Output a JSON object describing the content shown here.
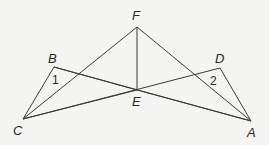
{
  "diagram": {
    "points": {
      "F": {
        "x": 137,
        "y": 27,
        "label": "F",
        "lx": 132,
        "ly": 20
      },
      "B": {
        "x": 54,
        "y": 67,
        "label": "B",
        "lx": 48,
        "ly": 63
      },
      "C": {
        "x": 23,
        "y": 119,
        "label": "C",
        "lx": 13,
        "ly": 135
      },
      "E": {
        "x": 137,
        "y": 90,
        "label": "E",
        "lx": 132,
        "ly": 106
      },
      "D": {
        "x": 220,
        "y": 68,
        "label": "D",
        "lx": 215,
        "ly": 63
      },
      "A": {
        "x": 251,
        "y": 121,
        "label": "A",
        "lx": 247,
        "ly": 137
      }
    },
    "segments": [
      [
        "C",
        "F"
      ],
      [
        "F",
        "A"
      ],
      [
        "F",
        "E"
      ],
      [
        "C",
        "B"
      ],
      [
        "B",
        "E"
      ],
      [
        "C",
        "E"
      ],
      [
        "E",
        "A"
      ],
      [
        "C",
        "D"
      ],
      [
        "D",
        "A"
      ],
      [
        "B",
        "A"
      ]
    ],
    "angle_labels": [
      {
        "text": "1",
        "x": 52,
        "y": 84
      },
      {
        "text": "2",
        "x": 210,
        "y": 85
      }
    ]
  }
}
